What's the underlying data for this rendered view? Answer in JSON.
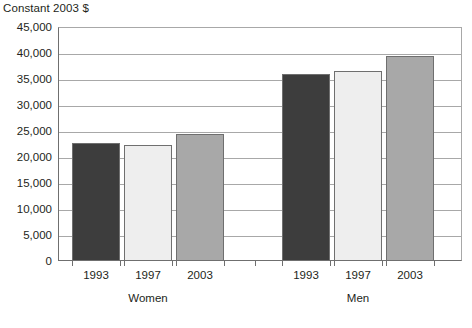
{
  "chart_data": {
    "type": "bar",
    "title": "Constant 2003 $",
    "xlabel": "",
    "ylabel": "",
    "ylim": [
      0,
      45000
    ],
    "grid": true,
    "legend": "none",
    "groups": [
      {
        "name": "Women",
        "categories": [
          "1993",
          "1997",
          "2003"
        ],
        "values": [
          22700,
          22400,
          24500
        ]
      },
      {
        "name": "Men",
        "categories": [
          "1993",
          "1997",
          "2003"
        ],
        "values": [
          36000,
          36600,
          39400
        ]
      }
    ],
    "series": [
      {
        "name": "1993",
        "color": "#3d3d3d",
        "values": [
          22700,
          36000
        ]
      },
      {
        "name": "1997",
        "color": "#eeeeee",
        "values": [
          22400,
          36600
        ]
      },
      {
        "name": "2003",
        "color": "#a8a8a8",
        "values": [
          24500,
          39400
        ]
      }
    ],
    "yticks": [
      {
        "value": 45000,
        "label": "45,000"
      },
      {
        "value": 40000,
        "label": "40,000"
      },
      {
        "value": 35000,
        "label": "35,000"
      },
      {
        "value": 30000,
        "label": "30,000"
      },
      {
        "value": 25000,
        "label": "25,000"
      },
      {
        "value": 20000,
        "label": "20,000"
      },
      {
        "value": 15000,
        "label": "15,000"
      },
      {
        "value": 10000,
        "label": "10,000"
      },
      {
        "value": 5000,
        "label": "5,000"
      },
      {
        "value": 0,
        "label": "0"
      }
    ],
    "colors": {
      "bar_1993": "#3d3d3d",
      "bar_1997": "#eeeeee",
      "bar_2003": "#a8a8a8",
      "bar_outline": "#6f6f6f",
      "gridline": "#a8a8a8",
      "axis": "#6f6f6f",
      "text": "#231f20",
      "background": "#ffffff"
    }
  }
}
